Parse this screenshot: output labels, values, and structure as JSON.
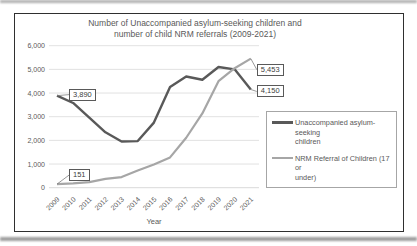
{
  "chart_data": {
    "type": "line",
    "title": "Number of Unaccompanied asylum-seeking children and number of child NRM referrals (2009-2021)",
    "title_lines": [
      "Number of Unaccompanied asylum-seeking children and",
      "number of child NRM referrals (2009-2021)"
    ],
    "xlabel": "Year",
    "ylabel": "",
    "ylim": [
      0,
      6000
    ],
    "ytick_step": 1000,
    "ytick_labels": [
      "0",
      "1,000",
      "2,000",
      "3,000",
      "4,000",
      "5,000",
      "6,000"
    ],
    "grid": true,
    "legend_position": "right",
    "categories": [
      "2009",
      "2010",
      "2011",
      "2012",
      "2013",
      "2014",
      "2015",
      "2016",
      "2017",
      "2018",
      "2019",
      "2020",
      "2021"
    ],
    "series": [
      {
        "name": "Unaccompanied asylum-seeking children",
        "color": "#595959",
        "values": [
          3890,
          3580,
          2960,
          2340,
          1950,
          1970,
          2750,
          4250,
          4700,
          4560,
          5100,
          5000,
          4150
        ]
      },
      {
        "name": "NRM Referral of Children (17 or under)",
        "color": "#a6a6a6",
        "values": [
          151,
          180,
          235,
          370,
          450,
          730,
          980,
          1280,
          2110,
          3140,
          4500,
          5050,
          5453
        ]
      }
    ],
    "callouts": [
      {
        "text": "3,890",
        "series": 0,
        "index": 0
      },
      {
        "text": "5,453",
        "series": 1,
        "index": 12
      },
      {
        "text": "4,150",
        "series": 0,
        "index": 12
      },
      {
        "text": "151",
        "series": 1,
        "index": 0
      }
    ]
  },
  "legend": {
    "entries": [
      {
        "line1": "Unaccompanied asylum-seeking",
        "line2": "children"
      },
      {
        "line1": "NRM Referral of Children (17 or",
        "line2": "under)"
      }
    ]
  },
  "colors": {
    "grid": "#d9d9d9",
    "axis_text": "#595959",
    "series1": "#595959",
    "series2": "#a6a6a6",
    "frame_border": "#2f2f2f",
    "legend_border": "#a6a6a6",
    "callout_border": "#595959",
    "connector": "#7f7f7f"
  }
}
